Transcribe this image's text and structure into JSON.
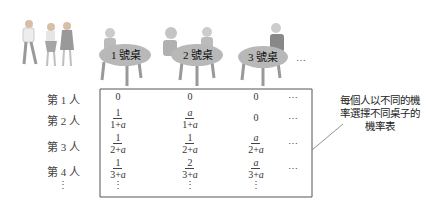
{
  "tables": [
    {
      "label": "1 號桌"
    },
    {
      "label": "2 號桌"
    },
    {
      "label": "3 號桌"
    }
  ],
  "tables_more": "…",
  "rows": [
    {
      "label": "第 1 人",
      "cells": [
        {
          "type": "text",
          "value": "0"
        },
        {
          "type": "text",
          "value": "0"
        },
        {
          "type": "text",
          "value": "0"
        }
      ],
      "more": "⋯"
    },
    {
      "label": "第 2 人",
      "cells": [
        {
          "type": "frac",
          "num": "1",
          "den": "1+a"
        },
        {
          "type": "frac",
          "num": "a",
          "den": "1+a"
        },
        {
          "type": "text",
          "value": "0"
        }
      ],
      "more": "⋯"
    },
    {
      "label": "第 3 人",
      "cells": [
        {
          "type": "frac",
          "num": "1",
          "den": "2+a"
        },
        {
          "type": "frac",
          "num": "1",
          "den": "2+a"
        },
        {
          "type": "frac",
          "num": "a",
          "den": "2+a"
        }
      ],
      "more": "⋯"
    },
    {
      "label": "第 4 人",
      "cells": [
        {
          "type": "frac",
          "num": "1",
          "den": "3+a"
        },
        {
          "type": "frac",
          "num": "2",
          "den": "3+a"
        },
        {
          "type": "frac",
          "num": "a",
          "den": "3+a"
        }
      ],
      "more": "⋯"
    }
  ],
  "vertical_ellipsis": "⋮",
  "annotation": [
    "每個人以不同的機",
    "率選擇不同桌子的",
    "機率表"
  ],
  "colors": {
    "table_top": "#b8b8b8",
    "table_leg": "#9a9a9a",
    "matrix_border": "#555555"
  }
}
